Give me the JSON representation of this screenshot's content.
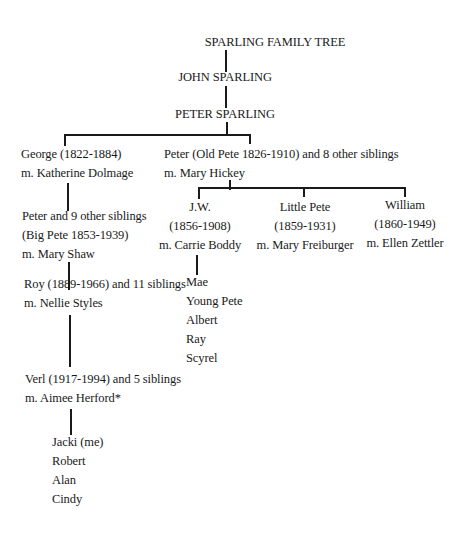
{
  "title": "SPARLING FAMILY TREE",
  "generations": {
    "g1": "JOHN SPARLING",
    "g2": "PETER SPARLING",
    "george": {
      "line1": "George (1822-1884)",
      "line2": "m. Katherine Dolmage"
    },
    "old_pete": {
      "line1": "Peter (Old Pete 1826-1910) and 8 other siblings",
      "line2": "m. Mary Hickey"
    },
    "big_pete": {
      "line1": "Peter and 9 other siblings",
      "line2": "(Big Pete 1853-1939)",
      "line3": "m. Mary Shaw"
    },
    "roy": {
      "line1": "Roy (1889-1966) and 11 siblings",
      "line2": "m. Nellie Styles"
    },
    "verl": {
      "line1": "Verl (1917-1994) and 5 siblings",
      "line2": "m. Aimee Herford*"
    },
    "verl_children": [
      "Jacki (me)",
      "Robert",
      "Alan",
      "Cindy"
    ],
    "jw": {
      "line1": "J.W.",
      "line2": "(1856-1908)",
      "line3": "m. Carrie Boddy"
    },
    "jw_children": [
      "Mae",
      "Young Pete",
      "Albert",
      "Ray",
      "Scyrel"
    ],
    "little_pete": {
      "line1": "Little Pete",
      "line2": "(1859-1931)",
      "line3": "m. Mary Freiburger"
    },
    "william": {
      "line1": "William",
      "line2": "(1860-1949)",
      "line3": "m. Ellen Zettler"
    }
  }
}
